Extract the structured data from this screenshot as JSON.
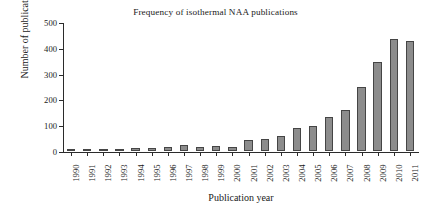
{
  "chart_data": {
    "type": "bar",
    "title": "Frequency of isothermal NAA publications",
    "xlabel": "Publication year",
    "ylabel": "Number of publications",
    "categories": [
      "1990",
      "1991",
      "1992",
      "1993",
      "1994",
      "1995",
      "1996",
      "1997",
      "1998",
      "1999",
      "2000",
      "2001",
      "2002",
      "2003",
      "2004",
      "2005",
      "2006",
      "2007",
      "2008",
      "2009",
      "2010",
      "2011"
    ],
    "values": [
      3,
      2,
      2,
      2,
      11,
      10,
      15,
      25,
      14,
      18,
      17,
      42,
      46,
      58,
      89,
      97,
      132,
      159,
      248,
      346,
      435,
      427
    ],
    "ylim": [
      0,
      500
    ],
    "yticks": [
      0,
      100,
      200,
      300,
      400,
      500
    ],
    "ytick_labels": [
      "0",
      "100",
      "200",
      "300",
      "400",
      "500"
    ],
    "grid": false,
    "legend": null,
    "bar_color": "#8c8c8c",
    "bar_edge_color": "#454545",
    "axis_color": "#2b2b2b",
    "background": "#ffffff"
  }
}
